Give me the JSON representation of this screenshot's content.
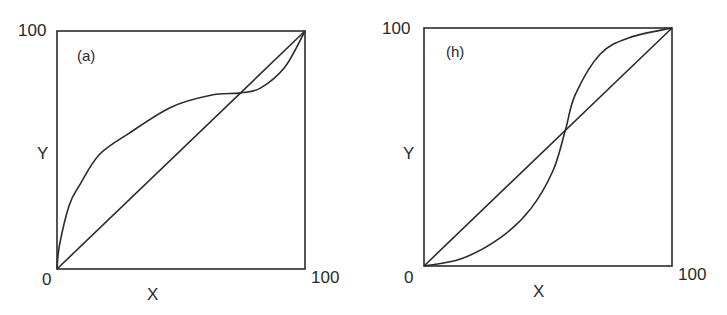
{
  "chart_data": [
    {
      "type": "line",
      "panel_label": "(a)",
      "title": "",
      "xlabel": "X",
      "ylabel": "Y",
      "xlim": [
        0,
        100
      ],
      "ylim": [
        0,
        100
      ],
      "x_tick_labels": [
        "0",
        "100"
      ],
      "y_tick_labels": [
        "0",
        "100"
      ],
      "grid": false,
      "legend": null,
      "series": [
        {
          "name": "diagonal",
          "x": [
            0,
            100
          ],
          "y": [
            0,
            100
          ]
        },
        {
          "name": "curve",
          "x": [
            0,
            1,
            5,
            9,
            17,
            29,
            46,
            62,
            74,
            82,
            92,
            100
          ],
          "y": [
            0,
            10,
            27,
            35,
            48,
            57,
            68,
            73,
            74,
            76,
            85,
            100
          ]
        }
      ],
      "annotations": [
        "curve crosses diagonal near (74, 74)"
      ]
    },
    {
      "type": "line",
      "panel_label": "(h)",
      "title": "",
      "xlabel": "X",
      "ylabel": "Y",
      "xlim": [
        0,
        100
      ],
      "ylim": [
        0,
        100
      ],
      "x_tick_labels": [
        "0",
        "100"
      ],
      "y_tick_labels": [
        "0",
        "100"
      ],
      "grid": false,
      "legend": null,
      "series": [
        {
          "name": "diagonal",
          "x": [
            0,
            100
          ],
          "y": [
            0,
            100
          ]
        },
        {
          "name": "curve",
          "x": [
            0,
            15,
            31,
            43,
            52,
            57,
            61,
            71,
            83,
            100
          ],
          "y": [
            0,
            3,
            12,
            24,
            40,
            57,
            72,
            89,
            96,
            100
          ]
        }
      ],
      "annotations": [
        "curve crosses diagonal near (57, 57)"
      ]
    }
  ],
  "panels": [
    {
      "label": "(a)",
      "y_max": "100",
      "y_min": "0",
      "x_max": "100",
      "xlabel": "X",
      "ylabel": "Y"
    },
    {
      "label": "(h)",
      "y_max": "100",
      "y_min": "0",
      "x_max": "100",
      "xlabel": "X",
      "ylabel": "Y"
    }
  ],
  "colors": {
    "line": "#2b2b2b",
    "background": "#ffffff"
  }
}
